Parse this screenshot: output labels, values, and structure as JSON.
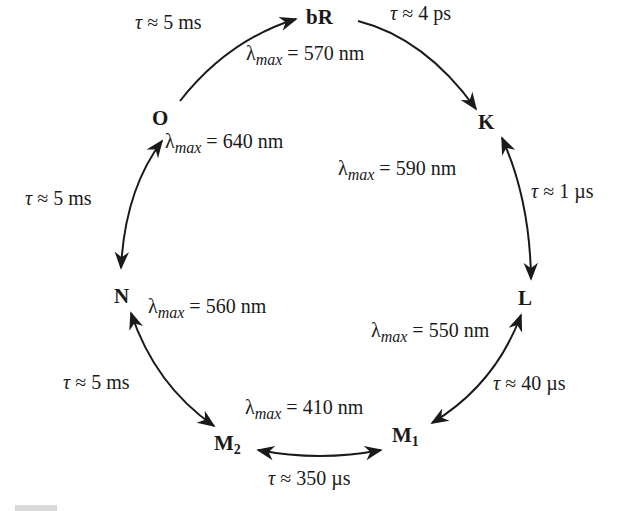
{
  "nodes": {
    "bR": {
      "label": "bR"
    },
    "K": {
      "label": "K"
    },
    "L": {
      "label": "L"
    },
    "M1": {
      "label": "M",
      "sub": "1"
    },
    "M2": {
      "label": "M",
      "sub": "2"
    },
    "N": {
      "label": "N"
    },
    "O": {
      "label": "O"
    }
  },
  "absorption": {
    "symbol": "λ",
    "subscript": "max",
    "bR": "= 570 nm",
    "K": "= 590 nm",
    "L": "= 550 nm",
    "M": "= 410 nm",
    "N": "= 560 nm",
    "O": "= 640 nm"
  },
  "transitions": [
    {
      "from": "O",
      "to": "bR",
      "direction": "forward",
      "symbol": "τ",
      "lifetime": "≈ 5 ms"
    },
    {
      "from": "bR",
      "to": "K",
      "direction": "forward",
      "symbol": "τ",
      "lifetime": "≈ 4 ps"
    },
    {
      "from": "K",
      "to": "L",
      "direction": "bidirectional",
      "symbol": "τ",
      "lifetime": "≈ 1 µs"
    },
    {
      "from": "L",
      "to": "M1",
      "direction": "bidirectional",
      "symbol": "τ",
      "lifetime": "≈ 40 µs"
    },
    {
      "from": "M1",
      "to": "M2",
      "direction": "bidirectional",
      "symbol": "τ",
      "lifetime": "≈ 350 µs"
    },
    {
      "from": "M2",
      "to": "N",
      "direction": "bidirectional",
      "symbol": "τ",
      "lifetime": "≈ 5 ms"
    },
    {
      "from": "N",
      "to": "O",
      "direction": "bidirectional",
      "symbol": "τ",
      "lifetime": "≈ 5 ms"
    }
  ],
  "colors": {
    "ink": "#1a1a1a",
    "background": "#ffffff"
  }
}
